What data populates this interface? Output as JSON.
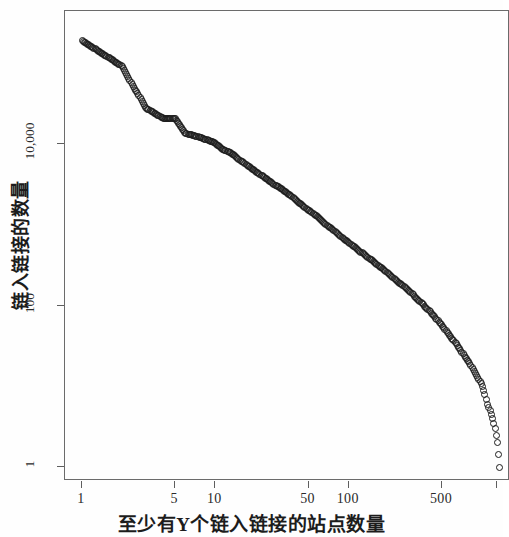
{
  "chart_data": {
    "type": "scatter",
    "title": "",
    "xlabel": "至少有Y个链入链接的站点数量",
    "ylabel": "链入链接的数量",
    "xscale": "log",
    "yscale": "log",
    "xlim": [
      1,
      1400
    ],
    "ylim": [
      1,
      300000
    ],
    "grid": false,
    "legend": null,
    "marker": "open-circle",
    "marker_color": "#1b1b1b",
    "xticks": [
      {
        "value": 1,
        "label": "1"
      },
      {
        "value": 5,
        "label": "5"
      },
      {
        "value": 10,
        "label": "10"
      },
      {
        "value": 50,
        "label": "50"
      },
      {
        "value": 100,
        "label": "100"
      },
      {
        "value": 500,
        "label": "500"
      },
      {
        "value": 1300,
        "label": ""
      }
    ],
    "yticks": [
      {
        "value": 1,
        "label": "1"
      },
      {
        "value": 100,
        "label": "100"
      },
      {
        "value": 10000,
        "label": "10,000"
      }
    ],
    "series": [
      {
        "name": "inbound-links-rank-distribution",
        "points": [
          [
            1,
            190000
          ],
          [
            2,
            92000
          ],
          [
            3,
            28000
          ],
          [
            4,
            21000
          ],
          [
            5,
            20500
          ],
          [
            6,
            13500
          ],
          [
            7,
            12600
          ],
          [
            8,
            11800
          ],
          [
            9,
            11000
          ],
          [
            10,
            10200
          ],
          [
            11,
            9000
          ],
          [
            12,
            8200
          ],
          [
            13,
            7800
          ],
          [
            14,
            7200
          ],
          [
            15,
            6400
          ],
          [
            16,
            6000
          ],
          [
            17,
            5600
          ],
          [
            18,
            5200
          ],
          [
            19,
            4900
          ],
          [
            20,
            4600
          ],
          [
            22,
            4100
          ],
          [
            24,
            3700
          ],
          [
            26,
            3400
          ],
          [
            28,
            3100
          ],
          [
            30,
            2900
          ],
          [
            33,
            2600
          ],
          [
            36,
            2350
          ],
          [
            39,
            2100
          ],
          [
            42,
            1900
          ],
          [
            46,
            1700
          ],
          [
            50,
            1520
          ],
          [
            55,
            1350
          ],
          [
            60,
            1200
          ],
          [
            65,
            1060
          ],
          [
            70,
            960
          ],
          [
            76,
            870
          ],
          [
            82,
            790
          ],
          [
            89,
            700
          ],
          [
            96,
            630
          ],
          [
            104,
            570
          ],
          [
            112,
            520
          ],
          [
            121,
            470
          ],
          [
            131,
            425
          ],
          [
            142,
            385
          ],
          [
            153,
            350
          ],
          [
            166,
            315
          ],
          [
            179,
            285
          ],
          [
            194,
            255
          ],
          [
            210,
            230
          ],
          [
            227,
            205
          ],
          [
            245,
            185
          ],
          [
            265,
            165
          ],
          [
            287,
            148
          ],
          [
            310,
            131
          ],
          [
            335,
            116
          ],
          [
            362,
            102
          ],
          [
            392,
            89
          ],
          [
            424,
            78
          ],
          [
            458,
            67
          ],
          [
            496,
            58
          ],
          [
            536,
            49
          ],
          [
            580,
            41
          ],
          [
            627,
            35
          ],
          [
            678,
            29
          ],
          [
            733,
            24
          ],
          [
            793,
            20
          ],
          [
            857,
            16
          ],
          [
            927,
            13
          ],
          [
            1003,
            10
          ],
          [
            1050,
            8
          ],
          [
            1100,
            6
          ],
          [
            1150,
            5
          ],
          [
            1200,
            4
          ],
          [
            1250,
            3
          ],
          [
            1300,
            2
          ],
          [
            1360,
            1
          ]
        ]
      }
    ]
  },
  "axis": {
    "x_title": "至少有Y个链入链接的站点数量",
    "y_title": "链入链接的数量"
  }
}
